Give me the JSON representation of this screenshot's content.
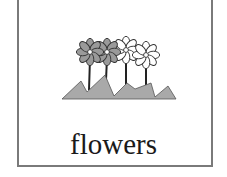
{
  "card": {
    "caption": "flowers",
    "illustration": "flowers-icon",
    "colors": {
      "border": "#7a7a7a",
      "ground": "#a9a9a9",
      "petal_filled": "#9a9a9a",
      "petal_empty": "#ffffff",
      "outline": "#333333",
      "caption": "#1a1a1a"
    }
  }
}
